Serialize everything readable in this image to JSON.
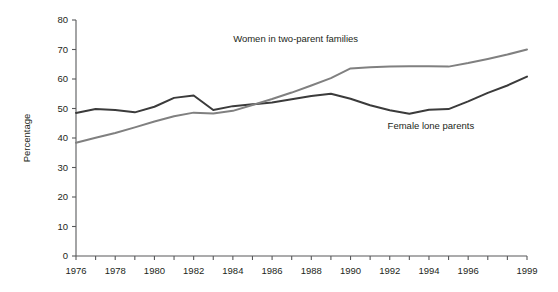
{
  "chart_data": {
    "type": "line",
    "title": "",
    "subtitle": "",
    "xlabel": "",
    "ylabel": "Percentage",
    "xlim": [
      1976,
      1999
    ],
    "ylim": [
      0,
      80
    ],
    "grid": false,
    "legend_position": "inline-annotation",
    "x": [
      1976,
      1977,
      1978,
      1979,
      1980,
      1981,
      1982,
      1983,
      1984,
      1985,
      1986,
      1987,
      1988,
      1989,
      1990,
      1991,
      1992,
      1993,
      1994,
      1995,
      1996,
      1997,
      1998,
      1999
    ],
    "x_tick_labels": [
      "1976",
      "1978",
      "1980",
      "1982",
      "1984",
      "1986",
      "1988",
      "1990",
      "1992",
      "1994",
      "1996",
      "1999"
    ],
    "x_tick_values": [
      1976,
      1978,
      1980,
      1982,
      1984,
      1986,
      1988,
      1990,
      1992,
      1994,
      1996,
      1999
    ],
    "y_tick_labels": [
      "0",
      "10",
      "20",
      "30",
      "40",
      "50",
      "60",
      "70",
      "80"
    ],
    "y_tick_values": [
      0,
      10,
      20,
      30,
      40,
      50,
      60,
      70,
      80
    ],
    "series": [
      {
        "name": "Female lone parents",
        "color": "#3b3b3b",
        "label_x": 1994.1,
        "label_y": 43.0,
        "values": [
          48.5,
          49.8,
          49.5,
          48.7,
          50.6,
          53.6,
          54.4,
          49.5,
          50.8,
          51.4,
          52.0,
          53.1,
          54.2,
          55.0,
          53.3,
          51.1,
          49.4,
          48.2,
          49.6,
          49.8,
          52.4,
          55.3,
          57.8,
          60.8
        ]
      },
      {
        "name": "Women in two-parent families",
        "color": "#808080",
        "label_x": 1987.2,
        "label_y": 72.4,
        "values": [
          38.4,
          40.1,
          41.7,
          43.6,
          45.6,
          47.4,
          48.6,
          48.3,
          49.2,
          51.2,
          53.2,
          55.4,
          57.8,
          60.3,
          63.6,
          64.0,
          64.2,
          64.3,
          64.3,
          64.2,
          65.4,
          66.8,
          68.3,
          70.0
        ]
      }
    ]
  }
}
